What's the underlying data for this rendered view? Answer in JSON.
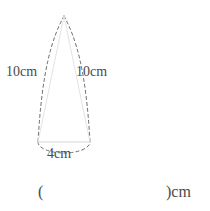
{
  "figure": {
    "name": "cone-geometry-figure",
    "shape": "cone",
    "stroke_solid_color": "#e8e8e8",
    "stroke_dashed_color": "#6b6b6b",
    "text_color": "#4a4a4a",
    "background_color": "#ffffff",
    "apex": {
      "x": 64,
      "y": 16
    },
    "base_center": {
      "x": 64,
      "y": 142
    },
    "base_radius_px": 26,
    "base_ellipse_ry_px": 11,
    "labels": {
      "slant_left": "10cm",
      "slant_right": "10cm",
      "diameter": "4cm"
    },
    "measurements": {
      "slant_height": 10,
      "base_diameter": 4,
      "unit": "cm"
    }
  },
  "answer": {
    "paren_open": "(",
    "paren_close_unit": ")cm",
    "value": ""
  }
}
